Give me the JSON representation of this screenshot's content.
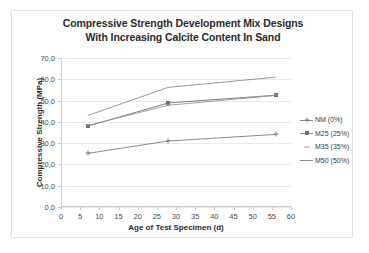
{
  "chart_data": {
    "type": "line",
    "title": "Compressive Strength Development Mix Designs With Increasing Calcite Content In Sand",
    "title_lines": [
      "Compressive Strength Development Mix Designs",
      "With Increasing Calcite Content In Sand"
    ],
    "xlabel": "Age of Test Specimen (d)",
    "ylabel": "Compressive Strength (MPa)",
    "xlim": [
      0,
      60
    ],
    "ylim": [
      0,
      70
    ],
    "grid": true,
    "legend_position": "right",
    "x": [
      7,
      28,
      56
    ],
    "xticks": [
      {
        "value": 0,
        "label": "0"
      },
      {
        "value": 5,
        "label": "5"
      },
      {
        "value": 10,
        "label": "10"
      },
      {
        "value": 15,
        "label": "15"
      },
      {
        "value": 20,
        "label": "20"
      },
      {
        "value": 25,
        "label": "25"
      },
      {
        "value": 30,
        "label": "30"
      },
      {
        "value": 35,
        "label": "35"
      },
      {
        "value": 40,
        "label": "40"
      },
      {
        "value": 45,
        "label": "45"
      },
      {
        "value": 50,
        "label": "50"
      },
      {
        "value": 55,
        "label": "55"
      },
      {
        "value": 60,
        "label": "60"
      }
    ],
    "yticks": [
      {
        "value": 0,
        "label": "0,0"
      },
      {
        "value": 10,
        "label": "10,0"
      },
      {
        "value": 20,
        "label": "20,0"
      },
      {
        "value": 30,
        "label": "30,0"
      },
      {
        "value": 40,
        "label": "40,0"
      },
      {
        "value": 50,
        "label": "50,0"
      },
      {
        "value": 60,
        "label": "60,0"
      },
      {
        "value": 70,
        "label": "70,0"
      }
    ],
    "series": [
      {
        "name": "NM (0%)",
        "marker": "cross",
        "color": "#7d7d7d",
        "values": [
          25.2,
          31.0,
          34.1
        ]
      },
      {
        "name": "M25 (25%)",
        "marker": "square",
        "color": "#6e6e6e",
        "values": [
          38.0,
          48.9,
          52.5
        ]
      },
      {
        "name": "M35 (35%)",
        "marker": "dash",
        "color": "#9a9a9a",
        "values": [
          38.3,
          47.8,
          52.4
        ]
      },
      {
        "name": "M50 (50%)",
        "marker": "none",
        "color": "#8d8d8d",
        "values": [
          43.0,
          56.2,
          61.0
        ]
      }
    ]
  },
  "legend": {
    "items": [
      {
        "label": "NM (0%)"
      },
      {
        "label": "M25 (25%)"
      },
      {
        "label": "M35 (35%)"
      },
      {
        "label": "M50 (50%)"
      }
    ]
  }
}
